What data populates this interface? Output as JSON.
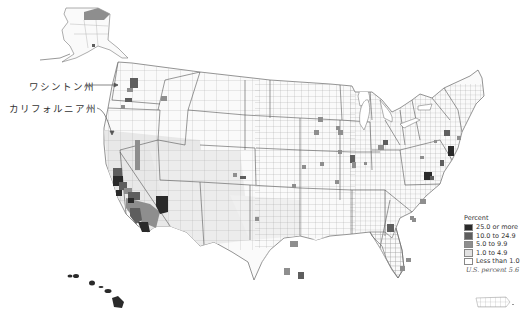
{
  "annotations": {
    "washington": "ワシントン州",
    "california": "カリフォルニア州"
  },
  "legend": {
    "title": "Percent",
    "items": [
      {
        "label": "25.0 or more",
        "color": "#2a2a2a"
      },
      {
        "label": "10.0 to 24.9",
        "color": "#5e5e5e"
      },
      {
        "label": "5.0 to 9.9",
        "color": "#8e8e8e"
      },
      {
        "label": "1.0 to 4.9",
        "color": "#e2e2e2"
      },
      {
        "label": "Less than 1.0",
        "color": "#ffffff"
      }
    ]
  },
  "us_percent": "U.S. percent 5.6",
  "colors": {
    "border": "#9a9a9a",
    "state_border": "#555555",
    "class_25_plus": "#2a2a2a",
    "class_10_24": "#5e5e5e",
    "class_5_9": "#8e8e8e",
    "class_1_4": "#e2e2e2",
    "class_lt1": "#ffffff"
  }
}
